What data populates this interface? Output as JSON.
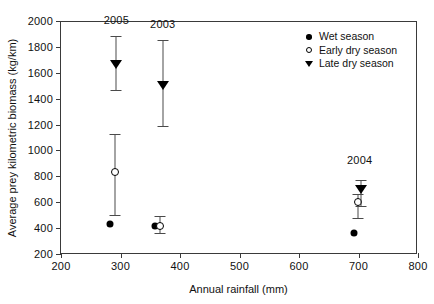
{
  "chart_data": {
    "type": "scatter",
    "title": "",
    "xlabel": "Annual rainfall (mm)",
    "ylabel": "Average prey kilometric biomass (kg/km)",
    "xlim": [
      200,
      800
    ],
    "ylim": [
      200,
      2000
    ],
    "xticks": [
      200,
      300,
      400,
      500,
      600,
      700,
      800
    ],
    "yticks": [
      200,
      400,
      600,
      800,
      1000,
      1200,
      1400,
      1600,
      1800,
      2000
    ],
    "grid": false,
    "legend_position": "top-right",
    "legend": [
      {
        "label": "Wet season",
        "marker": "filled-circle"
      },
      {
        "label": "Early dry season",
        "marker": "open-circle"
      },
      {
        "label": "Late dry season",
        "marker": "filled-triangle-down"
      }
    ],
    "annotations": [
      {
        "text": "2005",
        "x": 293,
        "y": 1960
      },
      {
        "text": "2003",
        "x": 371,
        "y": 1930
      },
      {
        "text": "2004",
        "x": 702,
        "y": 880
      }
    ],
    "series": [
      {
        "name": "Wet season",
        "marker": "filled-circle",
        "points": [
          {
            "group": "2005",
            "x": 283,
            "y": 428
          },
          {
            "group": "2003",
            "x": 358,
            "y": 413
          },
          {
            "group": "2004",
            "x": 692,
            "y": 365
          }
        ]
      },
      {
        "name": "Early dry season",
        "marker": "open-circle",
        "points": [
          {
            "group": "2005",
            "x": 291,
            "y": 830,
            "ymin": 500,
            "ymax": 1125
          },
          {
            "group": "2003",
            "x": 366,
            "y": 420,
            "ymin": 360,
            "ymax": 490
          },
          {
            "group": "2004",
            "x": 699,
            "y": 605,
            "ymin": 480,
            "ymax": 660
          }
        ]
      },
      {
        "name": "Late dry season",
        "marker": "filled-triangle-down",
        "points": [
          {
            "group": "2005",
            "x": 293,
            "y": 1665,
            "ymin": 1465,
            "ymax": 1885
          },
          {
            "group": "2003",
            "x": 371,
            "y": 1508,
            "ymin": 1185,
            "ymax": 1850
          },
          {
            "group": "2004",
            "x": 704,
            "y": 700,
            "ymin": 570,
            "ymax": 775
          }
        ]
      }
    ]
  }
}
